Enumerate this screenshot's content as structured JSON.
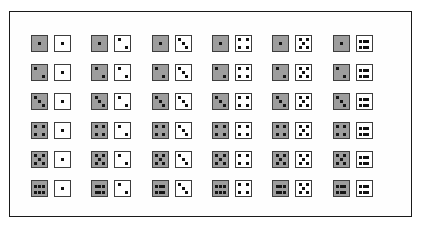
{
  "figure": {
    "name": "dice-sample-space-grid",
    "rows": 6,
    "columns": 6,
    "frame_border_color": "#1a1a1a",
    "shaded_die_color": "#9d9d9d",
    "plain_die_color": "#ffffff",
    "pip_color": "#111111",
    "die_border_color": "#3d3d3d"
  },
  "pip_layouts": {
    "1": [
      "c22"
    ],
    "2": [
      "c11",
      "c33"
    ],
    "3": [
      "c11",
      "c22",
      "c33"
    ],
    "4": [
      "c11",
      "c13",
      "c31",
      "c33"
    ],
    "5": [
      "c11",
      "c13",
      "c22",
      "c31",
      "c33"
    ],
    "6": [
      "g1",
      "g2",
      "g3",
      "g4",
      "g5",
      "g6"
    ]
  },
  "chart_data": {
    "type": "table",
    "title": "",
    "xlabel": "",
    "ylabel": "",
    "categories": [
      "1",
      "2",
      "3",
      "4",
      "5",
      "6"
    ],
    "cells": [
      [
        {
          "first": 1,
          "second": 1
        },
        {
          "first": 1,
          "second": 2
        },
        {
          "first": 1,
          "second": 3
        },
        {
          "first": 1,
          "second": 4
        },
        {
          "first": 1,
          "second": 5
        },
        {
          "first": 1,
          "second": 6
        }
      ],
      [
        {
          "first": 2,
          "second": 1
        },
        {
          "first": 2,
          "second": 2
        },
        {
          "first": 2,
          "second": 3
        },
        {
          "first": 2,
          "second": 4
        },
        {
          "first": 2,
          "second": 5
        },
        {
          "first": 2,
          "second": 6
        }
      ],
      [
        {
          "first": 3,
          "second": 1
        },
        {
          "first": 3,
          "second": 2
        },
        {
          "first": 3,
          "second": 3
        },
        {
          "first": 3,
          "second": 4
        },
        {
          "first": 3,
          "second": 5
        },
        {
          "first": 3,
          "second": 6
        }
      ],
      [
        {
          "first": 4,
          "second": 1
        },
        {
          "first": 4,
          "second": 2
        },
        {
          "first": 4,
          "second": 3
        },
        {
          "first": 4,
          "second": 4
        },
        {
          "first": 4,
          "second": 5
        },
        {
          "first": 4,
          "second": 6
        }
      ],
      [
        {
          "first": 5,
          "second": 1
        },
        {
          "first": 5,
          "second": 2
        },
        {
          "first": 5,
          "second": 3
        },
        {
          "first": 5,
          "second": 4
        },
        {
          "first": 5,
          "second": 5
        },
        {
          "first": 5,
          "second": 6
        }
      ],
      [
        {
          "first": 6,
          "second": 1
        },
        {
          "first": 6,
          "second": 2
        },
        {
          "first": 6,
          "second": 3
        },
        {
          "first": 6,
          "second": 4
        },
        {
          "first": 6,
          "second": 5
        },
        {
          "first": 6,
          "second": 6
        }
      ]
    ]
  }
}
